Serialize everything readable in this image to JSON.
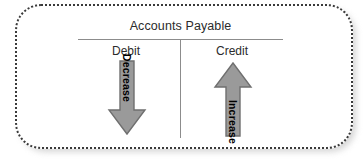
{
  "diagram": {
    "type": "t-account",
    "account_title": "Accounts Payable",
    "columns": [
      {
        "label": "Debit",
        "effect": "Decrease",
        "arrow": "down-arrow-icon"
      },
      {
        "label": "Credit",
        "effect": "Increase",
        "arrow": "up-arrow-icon"
      }
    ],
    "colors": {
      "arrow_fill": "#9a9a9a",
      "arrow_stroke": "#6f6f6f",
      "rule_line": "#8c8c8c",
      "text": "#2b2b2b",
      "label_text": "#000000",
      "border_dots": "#3a3a3a",
      "background": "#ffffff",
      "shadow": "#c9c9c9"
    }
  }
}
